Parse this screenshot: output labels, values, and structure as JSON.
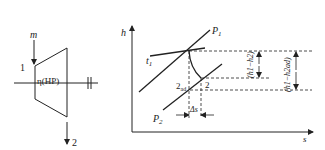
{
  "turbine": {
    "mass_flow_label": "m",
    "inlet_label": "1",
    "outlet_label": "2",
    "efficiency_label": "η(HP)"
  },
  "hs_diagram": {
    "y_axis_label": "h",
    "x_axis_label": "s",
    "isobar_high_label": "P",
    "isobar_high_sub": "1",
    "isobar_low_label": "P",
    "isobar_low_sub": "2",
    "isotherm_label": "t",
    "isotherm_sub": "1",
    "state_2ad_label": "2",
    "state_2ad_sub": "ad",
    "state_2_label": "2",
    "delta_s_label": "Δs",
    "dim_actual_label": "(h1−h2)",
    "dim_isentropic_label": "(h1−h2ad)"
  }
}
